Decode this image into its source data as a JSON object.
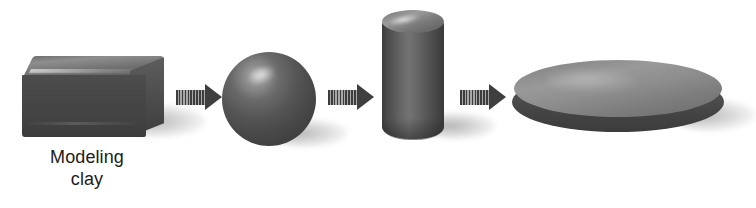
{
  "figure": {
    "background_color": "#ffffff",
    "width": 756,
    "height": 208
  },
  "labels": {
    "clay_line_1": "Modeling",
    "clay_line_2": "clay"
  },
  "palette": {
    "clay_dark": "#454545",
    "clay_mid": "#6a6a6a",
    "clay_light": "#9b9b9b",
    "highlight": "#e4e4e4",
    "shadow": "#b4b4b4",
    "arrow_dark": "#3f3f3f",
    "arrow_stripe_light": "#a8a8a8",
    "text": "#1c1c1c"
  },
  "stages": [
    {
      "id": "block",
      "name": "Rectangular block of modeling clay",
      "shape": "rectangular-block",
      "label": "Modeling clay",
      "order": 1
    },
    {
      "id": "sphere",
      "name": "Clay rolled into a ball",
      "shape": "sphere",
      "label": "",
      "order": 2
    },
    {
      "id": "cylinder",
      "name": "Clay formed into a tall cylinder",
      "shape": "cylinder",
      "label": "",
      "order": 3
    },
    {
      "id": "disk",
      "name": "Clay pressed into a flat disk",
      "shape": "flat-disk",
      "label": "",
      "order": 4
    }
  ],
  "arrows": [
    {
      "id": "arrow-1",
      "from": "block",
      "to": "sphere",
      "direction": "right",
      "style": "striped-tail-solid-head"
    },
    {
      "id": "arrow-2",
      "from": "sphere",
      "to": "cylinder",
      "direction": "right",
      "style": "striped-tail-solid-head"
    },
    {
      "id": "arrow-3",
      "from": "cylinder",
      "to": "disk",
      "direction": "right",
      "style": "striped-tail-solid-head"
    }
  ]
}
